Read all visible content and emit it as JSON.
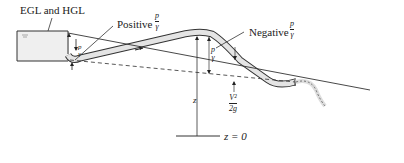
{
  "diagram": {
    "type": "siphon-energy-grade-line",
    "labels": {
      "egl_hgl": "EGL and HGL",
      "positive": "Positive",
      "negative": "Negative",
      "p": "p",
      "gamma": "γ",
      "z": "z",
      "v2": "V²",
      "two_g": "2g",
      "datum": "z = 0"
    },
    "colors": {
      "line": "#333333",
      "pipe_fill": "#e6e6e6",
      "tank_fill": "#f0f0f0"
    }
  }
}
